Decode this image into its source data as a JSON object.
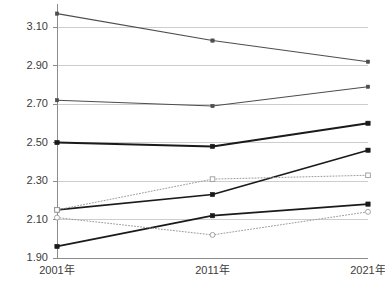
{
  "chart_data": {
    "type": "line",
    "title": "",
    "subtitle": "",
    "xlabel": "",
    "ylabel": "",
    "x": [
      "2001年",
      "2011年",
      "2021年"
    ],
    "categories": [
      "2001年",
      "2011年",
      "2021年"
    ],
    "ylim": [
      1.9,
      3.22
    ],
    "yticks": [
      "1.90",
      "2.10",
      "2.30",
      "2.50",
      "2.70",
      "2.90",
      "3.10"
    ],
    "ytick_values": [
      1.9,
      2.1,
      2.3,
      2.5,
      2.7,
      2.9,
      3.1
    ],
    "grid": "horizontal",
    "legend": "none",
    "series": [
      {
        "name": "series-1",
        "values": [
          3.17,
          3.03,
          2.92
        ],
        "style": "solid",
        "marker": "filled-square",
        "color": "#4d4d4d",
        "width": 1.1
      },
      {
        "name": "series-2",
        "values": [
          2.72,
          2.69,
          2.79
        ],
        "style": "solid",
        "marker": "filled-square",
        "color": "#4d4d4d",
        "width": 1.1
      },
      {
        "name": "series-3",
        "values": [
          2.5,
          2.48,
          2.6
        ],
        "style": "solid",
        "marker": "filled-square",
        "color": "#1a1a1a",
        "width": 2.0
      },
      {
        "name": "series-4",
        "values": [
          2.15,
          2.23,
          2.46
        ],
        "style": "solid",
        "marker": "filled-square",
        "color": "#1a1a1a",
        "width": 1.7
      },
      {
        "name": "series-5",
        "values": [
          1.96,
          2.12,
          2.18
        ],
        "style": "solid",
        "marker": "filled-square",
        "color": "#1a1a1a",
        "width": 1.7
      },
      {
        "name": "series-6",
        "values": [
          2.15,
          2.31,
          2.33
        ],
        "style": "dotted",
        "marker": "open-square",
        "color": "#9a9a9a",
        "width": 1.0
      },
      {
        "name": "series-7",
        "values": [
          2.11,
          2.02,
          2.14
        ],
        "style": "dotted",
        "marker": "open-circle",
        "color": "#9a9a9a",
        "width": 1.0
      }
    ]
  },
  "layout": {
    "plot_left": 57,
    "plot_right": 368,
    "plot_top": 4,
    "plot_bottom": 258,
    "background": "#ffffff",
    "grid_color": "#c8c8c8",
    "axis_color": "#8c8c8c",
    "label_color": "#3c3c3c"
  }
}
